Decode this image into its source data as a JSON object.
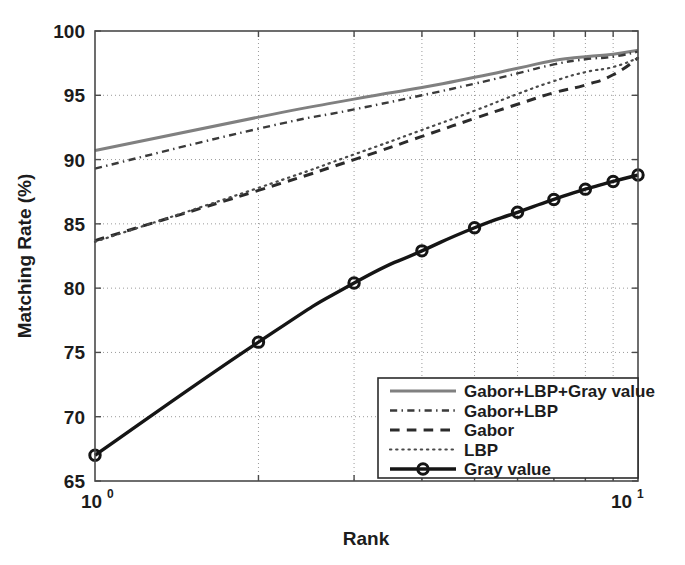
{
  "chart_data": {
    "type": "line",
    "title": "",
    "xlabel": "Rank",
    "ylabel": "Matching Rate (%)",
    "xscale": "log",
    "xlim": [
      1,
      10
    ],
    "ylim": [
      65,
      100
    ],
    "grid": true,
    "legend_position": "lower-right",
    "x": [
      1,
      2,
      3,
      4,
      5,
      6,
      7,
      8,
      9,
      10
    ],
    "xticks": [
      "10^0",
      "10^1"
    ],
    "xtick_labels": [
      "10",
      "10"
    ],
    "xtick_exponents": [
      "0",
      "1"
    ],
    "yticks": [
      65,
      70,
      75,
      80,
      85,
      90,
      95,
      100
    ],
    "ytick_labels": [
      "65",
      "70",
      "75",
      "80",
      "85",
      "90",
      "95",
      "100"
    ],
    "series": [
      {
        "name": "Gabor+LBP+Gray value",
        "style": "solid",
        "color": "#808080",
        "marker": "none",
        "width": 3.0,
        "values": [
          90.7,
          93.3,
          94.7,
          95.6,
          96.4,
          97.1,
          97.7,
          98.0,
          98.2,
          98.5
        ]
      },
      {
        "name": "Gabor+LBP",
        "style": "dashdot",
        "color": "#3a3a3a",
        "marker": "none",
        "width": 2.4,
        "values": [
          89.3,
          92.4,
          93.9,
          95.0,
          95.9,
          96.7,
          97.4,
          97.8,
          98.0,
          98.4
        ]
      },
      {
        "name": "Gabor",
        "style": "dashed",
        "color": "#2b2b2b",
        "marker": "none",
        "width": 3.0,
        "values": [
          83.7,
          87.6,
          90.0,
          91.8,
          93.2,
          94.3,
          95.2,
          95.8,
          96.6,
          97.9
        ]
      },
      {
        "name": "LBP",
        "style": "dotted",
        "color": "#4a4a4a",
        "marker": "none",
        "width": 2.2,
        "values": [
          83.6,
          87.8,
          90.4,
          92.3,
          93.8,
          95.1,
          96.1,
          96.8,
          97.2,
          97.9
        ]
      },
      {
        "name": "Gray value",
        "style": "solid",
        "color": "#151515",
        "marker": "circle",
        "width": 3.4,
        "values": [
          67.0,
          75.8,
          80.4,
          82.9,
          84.7,
          85.9,
          86.9,
          87.7,
          88.3,
          88.8
        ]
      }
    ]
  },
  "legend": {
    "items": [
      {
        "label": "Gabor+LBP+Gray value"
      },
      {
        "label": "Gabor+LBP"
      },
      {
        "label": "Gabor"
      },
      {
        "label": "LBP"
      },
      {
        "label": "Gray value"
      }
    ]
  },
  "colors": {
    "axis": "#4a4a4a",
    "grid": "#9a9a9a",
    "background": "#ffffff",
    "text": "#1c1c1c"
  }
}
